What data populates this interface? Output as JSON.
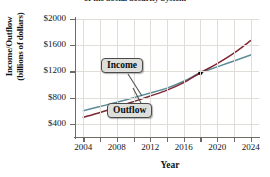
{
  "chart_data": {
    "type": "line",
    "title": "of the Social Security System",
    "xlabel": "Year",
    "ylabel_line1": "Income/Outflow",
    "ylabel_line2": "(billions of dollars)",
    "xlim": [
      2003,
      2025
    ],
    "ylim": [
      200,
      2000
    ],
    "xticks": [
      2004,
      2008,
      2012,
      2016,
      2020,
      2024
    ],
    "xtick_labels": [
      "2004",
      "2008",
      "2012",
      "2016",
      "2020",
      "2024"
    ],
    "xticks_minor": [
      2006,
      2010,
      2014,
      2018,
      2022
    ],
    "yticks": [
      400,
      800,
      1200,
      1600,
      2000
    ],
    "ytick_labels": [
      "$400",
      "$800",
      "$1200",
      "$1600",
      "$2000"
    ],
    "grid": true,
    "legend_position": "inline-callouts",
    "annotations": [
      {
        "label": "Income",
        "x": 2011,
        "y": 1200
      },
      {
        "label": "Outflow",
        "x": 2012,
        "y": 560
      }
    ],
    "intersection_point": {
      "x": 2018,
      "y": 1180
    },
    "series": [
      {
        "name": "Income",
        "color": "#5c8d99",
        "x": [
          2004,
          2006,
          2008,
          2010,
          2012,
          2014,
          2016,
          2018,
          2020,
          2022,
          2024
        ],
        "values": [
          600,
          665,
          730,
          800,
          870,
          945,
          1050,
          1180,
          1270,
          1360,
          1450
        ]
      },
      {
        "name": "Outflow",
        "color": "#7e2733",
        "x": [
          2004,
          2006,
          2008,
          2010,
          2012,
          2014,
          2016,
          2018,
          2020,
          2022,
          2024
        ],
        "values": [
          500,
          575,
          655,
          740,
          825,
          915,
          1030,
          1180,
          1320,
          1480,
          1670
        ]
      }
    ]
  },
  "ticks": {
    "y": [
      "$2000",
      "$1600",
      "$1200",
      "$800",
      "$400"
    ],
    "x": [
      "2004",
      "2008",
      "2012",
      "2016",
      "2020",
      "2024"
    ]
  },
  "labels": {
    "title": "of the Social Security System",
    "ylabel_line1": "Income/Outflow",
    "ylabel_line2": "(billions of dollars)",
    "xlabel": "Year",
    "income": "Income",
    "outflow": "Outflow"
  },
  "colors": {
    "income": "#5c8d99",
    "outflow": "#7e2733",
    "grid": "#e0dcd8",
    "axis": "#6e6a66",
    "callout_bg": "#dededa",
    "callout_border": "#4a4a4a",
    "point": "#000000"
  }
}
